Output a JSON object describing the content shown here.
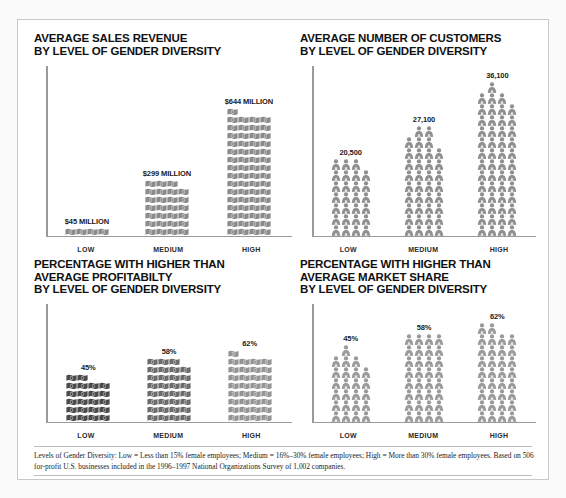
{
  "figure": {
    "background_color": "#ffffff",
    "frame_color": "#c9c9c9",
    "icon_gray": "#8d8d8d",
    "icon_dark": "#555555"
  },
  "panels": {
    "revenue": {
      "title": "AVERAGE SALES REVENUE\nBY LEVEL OF GENDER DIVERSITY",
      "icon": "money-bill-icon"
    },
    "customers": {
      "title": "AVERAGE NUMBER OF CUSTOMERS\nBY LEVEL OF GENDER DIVERSITY",
      "icon": "person-icon"
    },
    "profitability": {
      "title": "PERCENTAGE WITH HIGHER THAN\nAVERAGE PROFITABILTY\nBY LEVEL OF GENDER DIVERSITY",
      "icon": "money-bill-icon"
    },
    "market_share": {
      "title": "PERCENTAGE WITH HIGHER THAN\nAVERAGE MARKET SHARE\nBY LEVEL OF GENDER DIVERSITY",
      "icon": "person-icon"
    }
  },
  "footnote": "Levels of Gender Diversity: Low = Less than 15% female employees; Medium = 16%–30% female employees; High = More than 30% female employees. Based on 506 for-profit U.S. businesses included in the 1996–1997 National Organizations Survey of 1,002 companies.",
  "chart_data": [
    {
      "id": "revenue",
      "type": "bar",
      "title": "AVERAGE SALES REVENUE BY LEVEL OF GENDER DIVERSITY",
      "xlabel": "",
      "ylabel": "",
      "unit": "USD millions",
      "glyph": "money-bill-icon",
      "grid": false,
      "legend": "none",
      "categories": [
        "LOW",
        "MEDIUM",
        "HIGH"
      ],
      "values": [
        45,
        299,
        644
      ],
      "value_labels": [
        "$45 MILLION",
        "$299 MILLION",
        "$644 MILLION"
      ],
      "icon_columns": [
        [
          1,
          1,
          1,
          1
        ],
        [
          7,
          7,
          7,
          6
        ],
        [
          16,
          15,
          15,
          15
        ]
      ]
    },
    {
      "id": "customers",
      "type": "bar",
      "title": "AVERAGE NUMBER OF CUSTOMERS BY LEVEL OF GENDER DIVERSITY",
      "xlabel": "",
      "ylabel": "",
      "unit": "customers",
      "glyph": "person-icon",
      "grid": false,
      "legend": "none",
      "categories": [
        "LOW",
        "MEDIUM",
        "HIGH"
      ],
      "values": [
        20500,
        27100,
        36100
      ],
      "value_labels": [
        "20,500",
        "27,100",
        "36,100"
      ],
      "icon_columns": [
        [
          7,
          7,
          7,
          6
        ],
        [
          9,
          10,
          10,
          8
        ],
        [
          13,
          14,
          13,
          12
        ]
      ]
    },
    {
      "id": "profitability",
      "type": "bar",
      "title": "PERCENTAGE WITH HIGHER THAN AVERAGE PROFITABILTY BY LEVEL OF GENDER DIVERSITY",
      "xlabel": "",
      "ylabel": "",
      "unit": "percent",
      "glyph": "money-bill-icon",
      "grid": false,
      "legend": "none",
      "categories": [
        "LOW",
        "MEDIUM",
        "HIGH"
      ],
      "values": [
        45,
        58,
        62
      ],
      "value_labels": [
        "45%",
        "58%",
        "62%"
      ],
      "icon_columns": [
        [
          6,
          6,
          5,
          5
        ],
        [
          8,
          8,
          8,
          7
        ],
        [
          9,
          8,
          8,
          8
        ]
      ]
    },
    {
      "id": "market_share",
      "type": "bar",
      "title": "PERCENTAGE WITH HIGHER THAN AVERAGE MARKET SHARE BY LEVEL OF GENDER DIVERSITY",
      "xlabel": "",
      "ylabel": "",
      "unit": "percent",
      "glyph": "person-icon",
      "grid": false,
      "legend": "none",
      "categories": [
        "LOW",
        "MEDIUM",
        "HIGH"
      ],
      "values": [
        45,
        58,
        62
      ],
      "value_labels": [
        "45%",
        "58%",
        "62%"
      ],
      "icon_columns": [
        [
          6,
          7,
          6,
          5
        ],
        [
          8,
          8,
          8,
          8
        ],
        [
          9,
          9,
          8,
          8
        ]
      ]
    }
  ]
}
